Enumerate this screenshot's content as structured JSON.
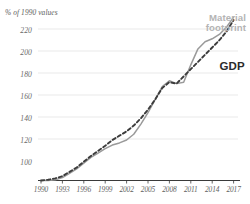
{
  "chart_data": {
    "type": "line",
    "title": "",
    "ylabel": "% of 1990 values",
    "xlabel": "",
    "ylim": [
      96,
      224
    ],
    "yticks": [
      100,
      120,
      140,
      160,
      180,
      200,
      220
    ],
    "xlim": [
      1990,
      2017
    ],
    "xticks": [
      1990,
      1993,
      1996,
      1999,
      2002,
      2005,
      2008,
      2011,
      2014,
      2017
    ],
    "grid": "horizontal",
    "legend_position": "inline-annotation",
    "x": [
      1990,
      1991,
      1992,
      1993,
      1994,
      1995,
      1996,
      1997,
      1998,
      1999,
      2000,
      2001,
      2002,
      2003,
      2004,
      2005,
      2006,
      2007,
      2008,
      2009,
      2010,
      2011,
      2012,
      2013,
      2014,
      2015,
      2016,
      2017
    ],
    "series": [
      {
        "name": "Material footprint",
        "style": "solid",
        "color": "#9a9a9a",
        "values": [
          100,
          100,
          100.5,
          102,
          105,
          108,
          112,
          116,
          119,
          122,
          124.5,
          126,
          128,
          132,
          139,
          147,
          156,
          165,
          169,
          167,
          168,
          180,
          191,
          196,
          198,
          201,
          206,
          213
        ]
      },
      {
        "name": "GDP",
        "style": "dashed",
        "color": "#3c3c3c",
        "values": [
          100,
          100.5,
          101.5,
          103,
          106,
          109,
          113,
          117,
          120.5,
          124,
          128,
          131,
          134,
          138,
          143,
          149,
          156,
          164,
          168,
          167,
          172,
          177,
          182,
          187,
          192,
          197,
          203,
          211
        ]
      }
    ],
    "annotations": [
      {
        "name": "material-footprint-label",
        "text": "Material\nfootprint",
        "color": "#b4b4b4"
      },
      {
        "name": "gdp-label",
        "text": "GDP",
        "color": "#2b2b2b"
      }
    ]
  },
  "axis": {
    "y_title": "% of 1990 values",
    "y_labels": [
      "220",
      "200",
      "180",
      "160",
      "140",
      "120",
      "100"
    ],
    "x_labels": [
      "1990",
      "1993",
      "1996",
      "1999",
      "2002",
      "2005",
      "2008",
      "2011",
      "2014",
      "2017"
    ]
  },
  "legend": {
    "material_footprint_line1": "Material",
    "material_footprint_line2": "footprint",
    "gdp": "GDP"
  },
  "colors": {
    "material_footprint": "#9a9a9a",
    "gdp": "#3c3c3c",
    "grid": "#e3e3e3",
    "axis": "#3a3a3a",
    "tick_text": "#606060",
    "legend_gray": "#b4b4b4"
  }
}
